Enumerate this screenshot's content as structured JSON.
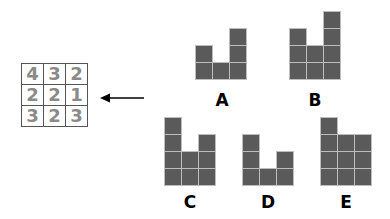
{
  "grid": {
    "rows": [
      [
        "4",
        "3",
        "2"
      ],
      [
        "2",
        "2",
        "1"
      ],
      [
        "3",
        "2",
        "3"
      ]
    ]
  },
  "arrow": {
    "direction": "left"
  },
  "options": [
    {
      "label": "A",
      "heights": [
        2,
        1,
        3
      ],
      "x": 196,
      "bottom": 80,
      "label_x": 207,
      "label_y": 90
    },
    {
      "label": "B",
      "heights": [
        3,
        2,
        4
      ],
      "x": 290,
      "bottom": 80,
      "label_x": 300,
      "label_y": 90
    },
    {
      "label": "C",
      "heights": [
        4,
        2,
        3
      ],
      "x": 165,
      "bottom": 186,
      "label_x": 175,
      "label_y": 192
    },
    {
      "label": "D",
      "heights": [
        3,
        1,
        2
      ],
      "x": 243,
      "bottom": 186,
      "label_x": 253,
      "label_y": 192
    },
    {
      "label": "E",
      "heights": [
        4,
        3,
        3
      ],
      "x": 321,
      "bottom": 186,
      "label_x": 331,
      "label_y": 192
    }
  ],
  "colors": {
    "block": "#5a5a5a",
    "block_border": "#bdbdbd",
    "grid_digits": "#8a8a8a"
  }
}
